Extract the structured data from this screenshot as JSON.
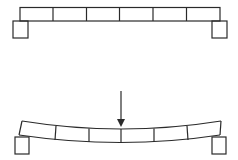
{
  "diagram": {
    "title": "",
    "stroke_color": "#2a2a2a",
    "background": "#ffffff",
    "top_beam": {
      "state": "unloaded",
      "segments": 6,
      "supports": [
        "left-support",
        "right-support"
      ]
    },
    "bottom_beam": {
      "state": "deflected",
      "segments": 6,
      "load": {
        "type": "point-load",
        "direction": "down",
        "position": "center"
      },
      "supports": [
        "left-support",
        "right-support"
      ]
    }
  }
}
